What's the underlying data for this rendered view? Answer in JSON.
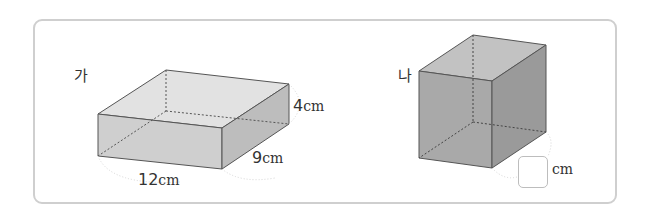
{
  "figures": {
    "a": {
      "label": "가",
      "length": "12",
      "width": "9",
      "height": "4",
      "unit": "cm"
    },
    "b": {
      "label": "나",
      "answer": "",
      "unit": "cm"
    }
  }
}
